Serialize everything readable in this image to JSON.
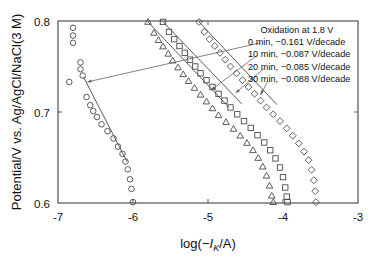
{
  "chart_data": {
    "type": "scatter",
    "title": "",
    "xlabel": "log(−Iₖ/A)",
    "ylabel": "Potential/V vs. Ag/AgCl/NaCl(3 M)",
    "xlim": [
      -7,
      -3
    ],
    "ylim": [
      0.6,
      0.8
    ],
    "xticks": [
      -7,
      -6,
      -5,
      -4,
      -3
    ],
    "xtick_labels": [
      "-7",
      "-6",
      "-5",
      "-4",
      "-3"
    ],
    "yticks": [
      0.6,
      0.7,
      0.8
    ],
    "ytick_labels": [
      "0.6",
      "0.7",
      "0.8"
    ],
    "grid": false,
    "legend_position": "top-right-inside",
    "annotation_title": "Oxidation at 1.8 V",
    "series": [
      {
        "name": "0 min",
        "slope_label": "0 min, −0.161 V/decade",
        "slope": -0.161,
        "marker": "circle",
        "fit_line": {
          "x": [
            -6.66,
            -6.08
          ],
          "y": [
            0.7385,
            0.6455
          ]
        },
        "points": [
          {
            "x": -6.8,
            "y": 0.7925
          },
          {
            "x": -6.8,
            "y": 0.784
          },
          {
            "x": -6.8,
            "y": 0.776
          },
          {
            "x": -6.7,
            "y": 0.7545
          },
          {
            "x": -6.7,
            "y": 0.747
          },
          {
            "x": -6.67,
            "y": 0.74
          },
          {
            "x": -6.85,
            "y": 0.733
          },
          {
            "x": -6.62,
            "y": 0.7165
          },
          {
            "x": -6.57,
            "y": 0.7075
          },
          {
            "x": -6.53,
            "y": 0.701
          },
          {
            "x": -6.48,
            "y": 0.6945
          },
          {
            "x": -6.42,
            "y": 0.6865
          },
          {
            "x": -6.34,
            "y": 0.679
          },
          {
            "x": -6.26,
            "y": 0.671
          },
          {
            "x": -6.2,
            "y": 0.662
          },
          {
            "x": -6.14,
            "y": 0.654
          },
          {
            "x": -6.1,
            "y": 0.6455
          },
          {
            "x": -6.07,
            "y": 0.637
          },
          {
            "x": -6.04,
            "y": 0.626
          },
          {
            "x": -6.02,
            "y": 0.6155
          },
          {
            "x": -6.0,
            "y": 0.601
          }
        ]
      },
      {
        "name": "10 min",
        "slope_label": "10 min, −0.087 V/decade",
        "slope": -0.087,
        "marker": "triangle",
        "fit_line": {
          "x": [
            -5.8,
            -4.72
          ],
          "y": [
            0.799,
            0.705
          ]
        },
        "points": [
          {
            "x": -5.8,
            "y": 0.799
          },
          {
            "x": -5.72,
            "y": 0.787
          },
          {
            "x": -5.66,
            "y": 0.779
          },
          {
            "x": -5.6,
            "y": 0.772
          },
          {
            "x": -5.53,
            "y": 0.764
          },
          {
            "x": -5.47,
            "y": 0.7565
          },
          {
            "x": -5.4,
            "y": 0.749
          },
          {
            "x": -5.33,
            "y": 0.7415
          },
          {
            "x": -5.26,
            "y": 0.734
          },
          {
            "x": -5.18,
            "y": 0.7265
          },
          {
            "x": -5.1,
            "y": 0.719
          },
          {
            "x": -5.02,
            "y": 0.7115
          },
          {
            "x": -4.94,
            "y": 0.704
          },
          {
            "x": -4.86,
            "y": 0.6965
          },
          {
            "x": -4.76,
            "y": 0.689
          },
          {
            "x": -4.66,
            "y": 0.6815
          },
          {
            "x": -4.57,
            "y": 0.674
          },
          {
            "x": -4.48,
            "y": 0.666
          },
          {
            "x": -4.4,
            "y": 0.658
          },
          {
            "x": -4.33,
            "y": 0.6495
          },
          {
            "x": -4.27,
            "y": 0.64
          },
          {
            "x": -4.22,
            "y": 0.63
          },
          {
            "x": -4.18,
            "y": 0.619
          },
          {
            "x": -4.15,
            "y": 0.608
          },
          {
            "x": -4.13,
            "y": 0.601
          }
        ]
      },
      {
        "name": "20 min",
        "slope_label": "20 min, −0.085 V/decade",
        "slope": -0.085,
        "marker": "square",
        "fit_line": {
          "x": [
            -5.6,
            -4.55
          ],
          "y": [
            0.799,
            0.709
          ]
        },
        "points": [
          {
            "x": -5.6,
            "y": 0.799
          },
          {
            "x": -5.52,
            "y": 0.788
          },
          {
            "x": -5.45,
            "y": 0.78
          },
          {
            "x": -5.38,
            "y": 0.7725
          },
          {
            "x": -5.31,
            "y": 0.765
          },
          {
            "x": -5.24,
            "y": 0.7575
          },
          {
            "x": -5.17,
            "y": 0.75
          },
          {
            "x": -5.1,
            "y": 0.7425
          },
          {
            "x": -5.02,
            "y": 0.735
          },
          {
            "x": -4.94,
            "y": 0.7275
          },
          {
            "x": -4.86,
            "y": 0.72
          },
          {
            "x": -4.78,
            "y": 0.7125
          },
          {
            "x": -4.7,
            "y": 0.705
          },
          {
            "x": -4.61,
            "y": 0.6975
          },
          {
            "x": -4.52,
            "y": 0.69
          },
          {
            "x": -4.43,
            "y": 0.6825
          },
          {
            "x": -4.34,
            "y": 0.6745
          },
          {
            "x": -4.25,
            "y": 0.6665
          },
          {
            "x": -4.17,
            "y": 0.658
          },
          {
            "x": -4.1,
            "y": 0.649
          },
          {
            "x": -4.04,
            "y": 0.639
          },
          {
            "x": -4.0,
            "y": 0.6285
          },
          {
            "x": -3.97,
            "y": 0.617
          },
          {
            "x": -3.95,
            "y": 0.607
          },
          {
            "x": -3.94,
            "y": 0.601
          }
        ]
      },
      {
        "name": "30 min",
        "slope_label": "30 min, −0.088 V/decade",
        "slope": -0.088,
        "marker": "diamond",
        "fit_line": {
          "x": [
            -5.12,
            -4.08
          ],
          "y": [
            0.799,
            0.708
          ]
        },
        "points": [
          {
            "x": -5.12,
            "y": 0.799
          },
          {
            "x": -5.05,
            "y": 0.788
          },
          {
            "x": -4.98,
            "y": 0.78
          },
          {
            "x": -4.91,
            "y": 0.7725
          },
          {
            "x": -4.84,
            "y": 0.765
          },
          {
            "x": -4.77,
            "y": 0.7575
          },
          {
            "x": -4.7,
            "y": 0.75
          },
          {
            "x": -4.62,
            "y": 0.7425
          },
          {
            "x": -4.54,
            "y": 0.735
          },
          {
            "x": -4.46,
            "y": 0.7275
          },
          {
            "x": -4.38,
            "y": 0.72
          },
          {
            "x": -4.3,
            "y": 0.7125
          },
          {
            "x": -4.22,
            "y": 0.705
          },
          {
            "x": -4.13,
            "y": 0.6975
          },
          {
            "x": -4.04,
            "y": 0.69
          },
          {
            "x": -3.95,
            "y": 0.682
          },
          {
            "x": -3.87,
            "y": 0.674
          },
          {
            "x": -3.79,
            "y": 0.6655
          },
          {
            "x": -3.72,
            "y": 0.6565
          },
          {
            "x": -3.66,
            "y": 0.647
          },
          {
            "x": -3.62,
            "y": 0.6365
          },
          {
            "x": -3.59,
            "y": 0.625
          },
          {
            "x": -3.57,
            "y": 0.613
          },
          {
            "x": -3.56,
            "y": 0.601
          }
        ]
      }
    ],
    "leader_lines": [
      {
        "series": "0 min",
        "from": {
          "x": -4.3,
          "y": 0.776
        },
        "to": {
          "x": -6.61,
          "y": 0.733
        }
      },
      {
        "series": "10 min",
        "from": {
          "x": -4.35,
          "y": 0.762
        },
        "to": {
          "x": -4.96,
          "y": 0.724
        }
      },
      {
        "series": "20 min",
        "from": {
          "x": -4.25,
          "y": 0.748
        },
        "to": {
          "x": -4.63,
          "y": 0.721
        }
      },
      {
        "series": "30 min",
        "from": {
          "x": -4.2,
          "y": 0.734
        },
        "to": {
          "x": -4.3,
          "y": 0.719
        }
      }
    ]
  },
  "axes": {
    "x_label_prefix": "log(−",
    "x_label_italic": "I",
    "x_label_sub": "K",
    "x_label_suffix": "/A)",
    "y_label": "Potential/V vs. Ag/AgCl/NaCl(3 M)"
  },
  "legend": {
    "title": "Oxidation at 1.8 V",
    "entries": [
      "0 min, −0.161 V/decade",
      "10 min, −0.087 V/decade",
      "20 min, −0.085 V/decade",
      "30 min, −0.088 V/decade"
    ]
  },
  "colors": {
    "axis": "#6b6b6b",
    "marker": "#4a4a4a",
    "line": "#5a5a5a",
    "text": "#111111",
    "background": "#ffffff"
  }
}
